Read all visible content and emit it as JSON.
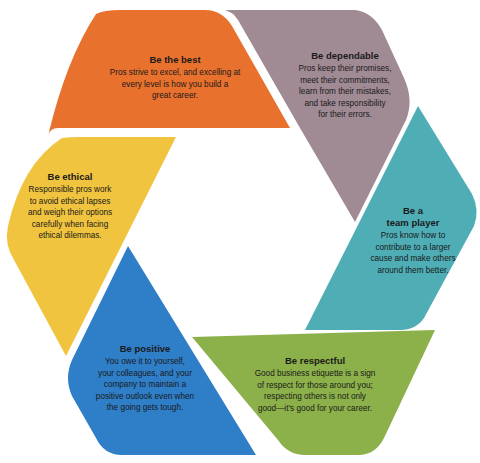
{
  "diagram": {
    "type": "hexagonal cycle of six segments",
    "segments": [
      {
        "id": "best",
        "title": "Be the best",
        "body_lines": [
          "Pros strive to excel, and excelling at",
          "every level is how you build a",
          "great career."
        ],
        "color": "#E8712E"
      },
      {
        "id": "dependable",
        "title": "Be dependable",
        "body_lines": [
          "Pros keep their promises,",
          "meet their commitments,",
          "learn from their mistakes,",
          "and take responsibility",
          "for their errors."
        ],
        "color": "#A08A94"
      },
      {
        "id": "team-player",
        "title_lines": [
          "Be a",
          "team player"
        ],
        "body_lines": [
          "Pros know how to",
          "contribute to a larger",
          "cause and make others",
          "around them better."
        ],
        "color": "#4FADB5"
      },
      {
        "id": "respectful",
        "title": "Be respectful",
        "body_lines": [
          "Good business etiquette is a sign",
          "of respect for those around you;",
          "respecting others is not only",
          "good—it’s good for your career."
        ],
        "color": "#8CB04A"
      },
      {
        "id": "positive",
        "title": "Be positive",
        "body_lines": [
          "You owe it to yourself,",
          "your colleagues, and your",
          "company to maintain a",
          "positive outlook even when",
          "the going gets tough."
        ],
        "color": "#2F7EC8"
      },
      {
        "id": "ethical",
        "title": "Be ethical",
        "body_lines": [
          "Responsible pros work",
          "to avoid ethical lapses",
          "and weigh their options",
          "carefully when facing",
          "ethical dilemmas."
        ],
        "color": "#F0C43E"
      }
    ]
  }
}
